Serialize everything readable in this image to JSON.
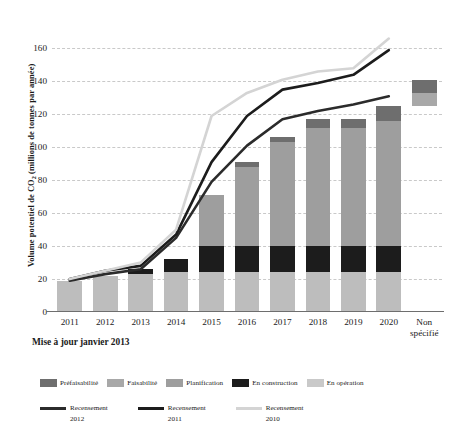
{
  "chart_data": {
    "type": "bar",
    "title": "",
    "subtitle": "",
    "xlabel": "",
    "ylabel": "Volume potentiel de CO2 (millions de tonnes par année)",
    "ylabel_parts": {
      "pre": "Volume potentiel de CO",
      "sub": "2",
      "post": " (millions de tonnes par année)"
    },
    "caption": "Mise à jour janvier 2013",
    "ylim": [
      0,
      170
    ],
    "yticks": [
      0,
      20,
      40,
      60,
      80,
      100,
      120,
      140,
      160
    ],
    "grid": true,
    "legend_position": "bottom",
    "categories": [
      "2011",
      "2012",
      "2013",
      "2014",
      "2015",
      "2016",
      "2017",
      "2018",
      "2019",
      "2020",
      "Non spécifié"
    ],
    "stack_order": [
      "En opération",
      "En construction",
      "Planification",
      "Faisabilité",
      "Préfaisabilité"
    ],
    "series": [
      {
        "name": "En opération",
        "color": "#bdbdbd",
        "values": [
          19,
          22,
          23,
          24,
          24,
          24,
          24,
          24,
          24,
          24,
          0
        ]
      },
      {
        "name": "En construction",
        "color": "#1c1c1c",
        "values": [
          0,
          0,
          3,
          8,
          16,
          16,
          16,
          16,
          16,
          16,
          0
        ]
      },
      {
        "name": "Planification",
        "color": "#9e9e9e",
        "values": [
          0,
          0,
          0,
          0,
          31,
          48,
          63,
          72,
          72,
          76,
          8
        ]
      },
      {
        "name": "Faisabilité",
        "color": "#a8a8a8",
        "values": [
          0,
          0,
          0,
          0,
          0,
          0,
          0,
          0,
          0,
          0,
          0
        ]
      },
      {
        "name": "Préfaisabilité",
        "color": "#6e6e6e",
        "values": [
          0,
          0,
          0,
          0,
          0,
          3,
          3,
          5,
          5,
          9,
          8
        ]
      }
    ],
    "bar_totals": [
      19,
      22,
      26,
      32,
      71,
      91,
      106,
      117,
      117,
      125,
      16
    ],
    "floating_bars": [
      {
        "category": "Non spécifié",
        "base": 125,
        "top": 141,
        "segments": [
          {
            "name": "Faisabilité",
            "from": 125,
            "to": 133,
            "color": "#a8a8a8"
          },
          {
            "name": "Préfaisabilité",
            "from": 133,
            "to": 141,
            "color": "#6e6e6e"
          }
        ]
      }
    ],
    "lines": [
      {
        "name": "Recensement 2012",
        "color": "#2b2b2b",
        "width": 2.6,
        "x": [
          "2011",
          "2012",
          "2013",
          "2014",
          "2015",
          "2016",
          "2017",
          "2018",
          "2019",
          "2020"
        ],
        "values": [
          19,
          23,
          26,
          45,
          79,
          101,
          117,
          122,
          126,
          131
        ]
      },
      {
        "name": "Recensement 2011",
        "color": "#1c1c1c",
        "width": 2.6,
        "x": [
          "2011",
          "2012",
          "2013",
          "2014",
          "2015",
          "2016",
          "2017",
          "2018",
          "2019",
          "2020"
        ],
        "values": [
          20,
          25,
          28,
          47,
          91,
          119,
          135,
          139,
          144,
          159
        ]
      },
      {
        "name": "Recensement 2010",
        "color": "#d4d4d4",
        "width": 2.6,
        "x": [
          "2011",
          "2012",
          "2013",
          "2014",
          "2015",
          "2016",
          "2017",
          "2018",
          "2019",
          "2020"
        ],
        "values": [
          20,
          25,
          30,
          50,
          119,
          133,
          141,
          146,
          148,
          166
        ]
      }
    ]
  },
  "legend": {
    "stack_items": [
      {
        "label": "Préfaisabilité",
        "color": "#6e6e6e"
      },
      {
        "label": "Faisabilité",
        "color": "#a8a8a8"
      },
      {
        "label": "Planification",
        "color": "#9e9e9e"
      },
      {
        "label": "En construction",
        "color": "#1c1c1c"
      },
      {
        "label": "En opération",
        "color": "#c9c9c9"
      }
    ],
    "line_items": [
      {
        "label_line1": "Recensement",
        "label_line2": "2012",
        "color": "#2b2b2b"
      },
      {
        "label_line1": "Recensement",
        "label_line2": "2011",
        "color": "#1c1c1c"
      },
      {
        "label_line1": "Recensement",
        "label_line2": "2010",
        "color": "#d4d4d4"
      }
    ]
  }
}
